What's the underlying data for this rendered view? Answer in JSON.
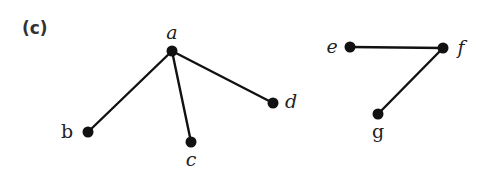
{
  "panel_label": "(c)",
  "graphs": [
    {
      "name": "tree-abcd",
      "nodes": [
        {
          "id": "a",
          "label": "a",
          "x": 172,
          "y": 51,
          "label_x": 172,
          "label_y": 39,
          "anchor": "middle",
          "italic": true
        },
        {
          "id": "b",
          "label": "b",
          "x": 88,
          "y": 132,
          "label_x": 67,
          "label_y": 138,
          "anchor": "middle",
          "italic": false
        },
        {
          "id": "c",
          "label": "c",
          "x": 191,
          "y": 142,
          "label_x": 191,
          "label_y": 166,
          "anchor": "middle",
          "italic": true
        },
        {
          "id": "d",
          "label": "d",
          "x": 273,
          "y": 103,
          "label_x": 291,
          "label_y": 108,
          "anchor": "middle",
          "italic": true
        }
      ],
      "edges": [
        {
          "from": "a",
          "to": "b"
        },
        {
          "from": "a",
          "to": "c"
        },
        {
          "from": "a",
          "to": "d"
        }
      ]
    },
    {
      "name": "path-efg",
      "nodes": [
        {
          "id": "e",
          "label": "e",
          "x": 350,
          "y": 47,
          "label_x": 332,
          "label_y": 53,
          "anchor": "middle",
          "italic": true
        },
        {
          "id": "f",
          "label": "f",
          "x": 443,
          "y": 48,
          "label_x": 461,
          "label_y": 54,
          "anchor": "middle",
          "italic": true
        },
        {
          "id": "g",
          "label": "g",
          "x": 378,
          "y": 114,
          "label_x": 378,
          "label_y": 138,
          "anchor": "middle",
          "italic": false
        }
      ],
      "edges": [
        {
          "from": "e",
          "to": "f"
        },
        {
          "from": "f",
          "to": "g"
        }
      ]
    }
  ],
  "colors": {
    "edge": "#111111",
    "node": "#111111",
    "label": "#222222",
    "background": "#ffffff"
  },
  "node_radius": 5.5
}
